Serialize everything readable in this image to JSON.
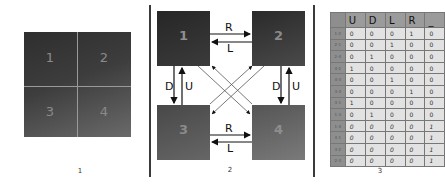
{
  "panels": [
    {
      "caption": "1",
      "quadrants": [
        "1",
        "2",
        "3",
        "4"
      ]
    },
    {
      "caption": "2",
      "nodes": [
        "1",
        "2",
        "3",
        "4"
      ],
      "edges": {
        "top_right": "R",
        "top_left": "L",
        "bottom_right": "R",
        "bottom_left": "L",
        "left_down": "D",
        "left_up": "U",
        "right_down": "D",
        "right_up": "U"
      }
    },
    {
      "caption": "3",
      "table": {
        "headers": [
          "",
          "U",
          "D",
          "L",
          "R",
          "_"
        ],
        "rows": [
          {
            "label": "1-2",
            "values": [
              "0",
              "0",
              "0",
              "1",
              "0"
            ]
          },
          {
            "label": "2-1",
            "values": [
              "0",
              "0",
              "1",
              "0",
              "0"
            ]
          },
          {
            "label": "2-4",
            "values": [
              "0",
              "1",
              "0",
              "0",
              "0"
            ]
          },
          {
            "label": "4-2",
            "values": [
              "1",
              "0",
              "0",
              "0",
              "0"
            ]
          },
          {
            "label": "4-3",
            "values": [
              "0",
              "0",
              "1",
              "0",
              "0"
            ]
          },
          {
            "label": "3-4",
            "values": [
              "0",
              "0",
              "0",
              "1",
              "0"
            ]
          },
          {
            "label": "3-1",
            "values": [
              "1",
              "0",
              "0",
              "0",
              "0"
            ]
          },
          {
            "label": "1-3",
            "values": [
              "0",
              "1",
              "0",
              "0",
              "0"
            ]
          },
          {
            "label": "1-4",
            "values": [
              "0",
              "0",
              "0",
              "0",
              "1"
            ]
          },
          {
            "label": "4-1",
            "values": [
              "0",
              "0",
              "0",
              "0",
              "1"
            ]
          },
          {
            "label": "3-2",
            "values": [
              "0",
              "0",
              "0",
              "0",
              "1"
            ]
          },
          {
            "label": "2-3",
            "values": [
              "0",
              "0",
              "0",
              "0",
              "1"
            ]
          }
        ]
      }
    }
  ]
}
